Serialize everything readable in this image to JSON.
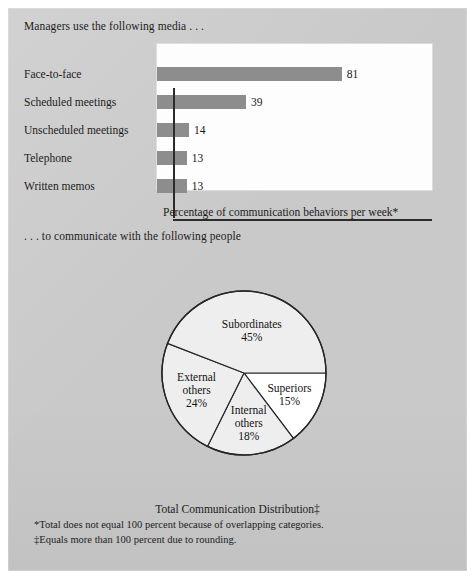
{
  "figure": {
    "lead_media": "Managers use the following media . . .",
    "lead_people": ". . . to communicate with the following people",
    "bar_caption": "Percentage of communication behaviors per week*",
    "pie_caption": "Total Communication Distribution‡",
    "footnotes": [
      "*Total does not equal 100 percent because of overlapping categories.",
      "‡Equals more than 100 percent due to rounding."
    ]
  },
  "colors": {
    "panel_background": "#c9c9c9",
    "plot_card": "#fdfdfd",
    "bar_fill": "#8d8d8d",
    "axis": "#2b2b2b",
    "pie_shaded": "#eeeeee",
    "pie_white": "#ffffff",
    "pie_stroke": "#262626",
    "text": "#1c1c1c"
  },
  "chart_data": [
    {
      "type": "bar",
      "title": "",
      "orientation": "horizontal",
      "xlabel": "Percentage of communication behaviors per week*",
      "ylabel": "",
      "grid": false,
      "legend": "none",
      "xlim": [
        0,
        100
      ],
      "categories": [
        "Face-to-face",
        "Scheduled meetings",
        "Unscheduled meetings",
        "Telephone",
        "Written memos"
      ],
      "values": [
        81,
        39,
        14,
        13,
        13
      ],
      "value_labels": [
        "81",
        "39",
        "14",
        "13",
        "13"
      ],
      "units": "percent"
    },
    {
      "type": "pie",
      "title": "Total Communication Distribution‡",
      "legend": "none",
      "start_angle_deg": 0,
      "direction": "clockwise",
      "slices": [
        {
          "label": "Superiors",
          "label_line1": "Superiors",
          "label_line2": "",
          "value": 15,
          "value_label": "15%",
          "fill": "#ffffff"
        },
        {
          "label": "Internal others",
          "label_line1": "Internal",
          "label_line2": "others",
          "value": 18,
          "value_label": "18%",
          "fill": "#eeeeee"
        },
        {
          "label": "External others",
          "label_line1": "External",
          "label_line2": "others",
          "value": 24,
          "value_label": "24%",
          "fill": "#eeeeee"
        },
        {
          "label": "Subordinates",
          "label_line1": "Subordinates",
          "label_line2": "",
          "value": 45,
          "value_label": "45%",
          "fill": "#eeeeee"
        }
      ],
      "total": 102
    }
  ]
}
